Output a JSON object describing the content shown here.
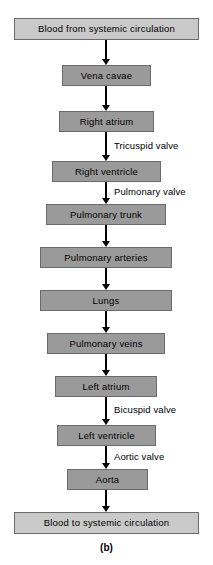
{
  "diagram": {
    "caption": "(b)",
    "nodes": [
      {
        "id": "blood-from-systemic-circulation",
        "label": "Blood from systemic circulation",
        "kind": "endpoint",
        "x": 14,
        "y": 18,
        "width": 185,
        "height": 22
      },
      {
        "id": "vena-cavae",
        "label": "Vena cavae",
        "kind": "vessel",
        "x": 62,
        "y": 65,
        "width": 89,
        "height": 21
      },
      {
        "id": "right-atrium",
        "label": "Right atrium",
        "kind": "vessel",
        "x": 59,
        "y": 111,
        "width": 95,
        "height": 21
      },
      {
        "id": "right-ventricle",
        "label": "Right ventricle",
        "kind": "vessel",
        "x": 52,
        "y": 161,
        "width": 109,
        "height": 21
      },
      {
        "id": "pulmonary-trunk",
        "label": "Pulmonary trunk",
        "kind": "vessel",
        "x": 46,
        "y": 204,
        "width": 120,
        "height": 21
      },
      {
        "id": "pulmonary-arteries",
        "label": "Pulmonary arteries",
        "kind": "vessel",
        "x": 40,
        "y": 247,
        "width": 132,
        "height": 21
      },
      {
        "id": "lungs",
        "label": "Lungs",
        "kind": "vessel",
        "x": 40,
        "y": 290,
        "width": 132,
        "height": 21
      },
      {
        "id": "pulmonary-veins",
        "label": "Pulmonary veins",
        "kind": "vessel",
        "x": 47,
        "y": 333,
        "width": 118,
        "height": 21
      },
      {
        "id": "left-atrium",
        "label": "Left atrium",
        "kind": "vessel",
        "x": 55,
        "y": 376,
        "width": 102,
        "height": 21
      },
      {
        "id": "left-ventricle",
        "label": "Left ventricle",
        "kind": "vessel",
        "x": 57,
        "y": 425,
        "width": 99,
        "height": 21
      },
      {
        "id": "aorta",
        "label": "Aorta",
        "kind": "vessel",
        "x": 67,
        "y": 469,
        "width": 81,
        "height": 21
      },
      {
        "id": "blood-to-systemic-circulation",
        "label": "Blood to systemic circulation",
        "kind": "endpoint",
        "x": 14,
        "y": 512,
        "width": 185,
        "height": 22
      }
    ],
    "connectors": [
      {
        "id": "to-vena-cavae",
        "x": 106,
        "y": 40,
        "length": 25,
        "label": ""
      },
      {
        "id": "to-right-atrium",
        "x": 106,
        "y": 86,
        "length": 25,
        "label": ""
      },
      {
        "id": "to-right-ventricle",
        "x": 106,
        "y": 132,
        "length": 29,
        "label": "Tricuspid valve",
        "label_x": 114,
        "label_y": 141
      },
      {
        "id": "to-pulmonary-trunk",
        "x": 106,
        "y": 182,
        "length": 22,
        "label": "Pulmonary valve",
        "label_x": 114,
        "label_y": 187
      },
      {
        "id": "to-pulmonary-arteries",
        "x": 106,
        "y": 225,
        "length": 22,
        "label": ""
      },
      {
        "id": "to-lungs",
        "x": 106,
        "y": 268,
        "length": 22,
        "label": ""
      },
      {
        "id": "to-pulmonary-veins",
        "x": 106,
        "y": 311,
        "length": 22,
        "label": ""
      },
      {
        "id": "to-left-atrium",
        "x": 106,
        "y": 354,
        "length": 22,
        "label": ""
      },
      {
        "id": "to-left-ventricle",
        "x": 106,
        "y": 397,
        "length": 28,
        "label": "Bicuspid valve",
        "label_x": 114,
        "label_y": 405
      },
      {
        "id": "to-aorta",
        "x": 106,
        "y": 446,
        "length": 23,
        "label": "Aortic valve",
        "label_x": 114,
        "label_y": 452
      },
      {
        "id": "to-blood-to-systemic-circulation",
        "x": 106,
        "y": 490,
        "length": 22,
        "label": ""
      }
    ]
  }
}
